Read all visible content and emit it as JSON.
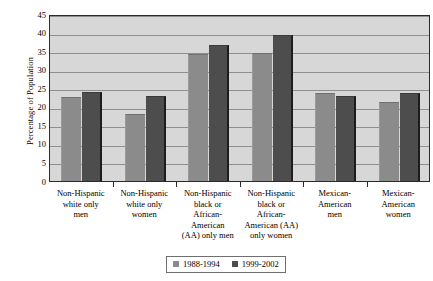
{
  "chart_data": {
    "type": "bar",
    "title": "",
    "xlabel": "",
    "ylabel": "Percentage of Population",
    "ylim": [
      0,
      45
    ],
    "ytick_step": 5,
    "yticks": [
      0,
      5,
      10,
      15,
      20,
      25,
      30,
      35,
      40,
      45
    ],
    "grid": true,
    "legend_position": "bottom",
    "categories": [
      "Non-Hispanic white only men",
      "Non-Hispanic white only women",
      "Non-Hispanic black or African-American (AA) only men",
      "Non-Hispanic black or African-American (AA) only women",
      "Mexican-American men",
      "Mexican-American women"
    ],
    "category_lines": [
      [
        "Non-Hispanic",
        "white only",
        "men"
      ],
      [
        "Non-Hispanic",
        "white only",
        "women"
      ],
      [
        "Non-Hispanic",
        "black or",
        "African-",
        "American",
        "(AA) only men"
      ],
      [
        "Non-Hispanic",
        "black or",
        "African-",
        "American (AA)",
        "only women"
      ],
      [
        "Mexican-",
        "American",
        "men"
      ],
      [
        "Mexican-",
        "American",
        "women"
      ]
    ],
    "series": [
      {
        "name": "1988-1994",
        "color": "#8b8b8b",
        "values": [
          22.6,
          18.1,
          34.2,
          34.5,
          23.8,
          21.2
        ]
      },
      {
        "name": "1999-2002",
        "color": "#4d4d4d",
        "values": [
          24.0,
          23.0,
          36.7,
          39.4,
          22.8,
          23.7
        ]
      }
    ]
  },
  "legend": {
    "entries": [
      {
        "label": "1988-1994"
      },
      {
        "label": "1999-2002"
      }
    ]
  },
  "axis": {
    "y_title": "Percentage of Population"
  },
  "colors": {
    "series_1988_1994": "#8b8b8b",
    "series_1999_2002": "#4d4d4d",
    "plot_background": "#d7d7d7",
    "gridline": "#8f8f8f",
    "frame": "#2b2b2b"
  }
}
